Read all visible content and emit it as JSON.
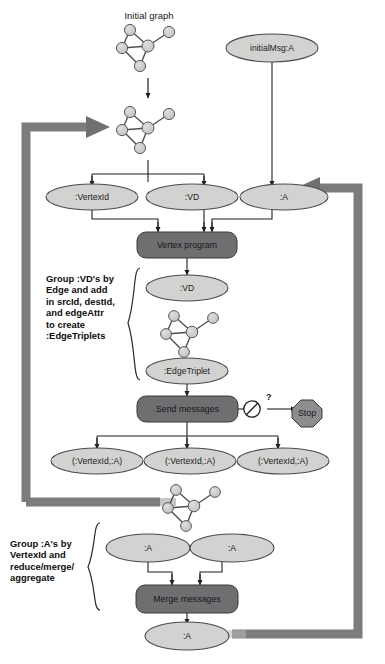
{
  "diagram": {
    "colors": {
      "ellipse_fill": "#d2d3d1",
      "ellipse_stroke": "#4a4a4a",
      "process_fill": "#6e6f70",
      "process_stroke": "#3a3a3a",
      "process_text": "#1a1a1a",
      "stop_fill": "#8c8d8e",
      "thick_arrow": "#7b7c7d",
      "thin_line": "#2b2b2b",
      "graph_node_fill": "#c9cac8",
      "graph_node_stroke": "#5a5a5a",
      "background": "#ffffff"
    },
    "labels": {
      "initial_graph": "Initial graph",
      "initial_msg": "initialMsg:A"
    },
    "nodes": {
      "vertex_id": ":VertexId",
      "vd": ":VD",
      "a": ":A",
      "vd_after": ":VD",
      "edge_triplet": ":EdgeTriplet",
      "vertexid_a_1": "(:VertexId,:A)",
      "vertexid_a_2": "(:VertexId,:A)",
      "vertexid_a_3": "(:VertexId,:A)",
      "a_left": ":A",
      "a_right": ":A",
      "a_final": ":A"
    },
    "processes": {
      "vertex_program": "Vertex program",
      "send_messages": "Send messages",
      "merge_messages": "Merge messages",
      "stop": "Stop"
    },
    "decision": {
      "question_mark": "?",
      "no_entry_symbol": "no-entry-icon"
    },
    "annotations": {
      "group_vd": "Group :VD's by\nEdge and add\nin srcId, destId,\nand edgeAttr\nto create\n:EdgeTriplets",
      "group_a": "Group :A's by\nVertexId and\nreduce/merge/\naggregate"
    },
    "graph_clusters": [
      {
        "name": "initial-graph-cluster",
        "nodes": [
          [
            26,
            8
          ],
          [
            65,
            10
          ],
          [
            44,
            24
          ],
          [
            18,
            26
          ],
          [
            36,
            44
          ]
        ],
        "edges": [
          [
            0,
            3
          ],
          [
            0,
            2
          ],
          [
            1,
            2
          ],
          [
            2,
            3
          ],
          [
            2,
            4
          ],
          [
            3,
            4
          ]
        ]
      },
      {
        "name": "iterated-graph-cluster",
        "nodes": [
          [
            26,
            8
          ],
          [
            65,
            10
          ],
          [
            44,
            24
          ],
          [
            18,
            26
          ],
          [
            36,
            44
          ]
        ],
        "edges": [
          [
            0,
            3
          ],
          [
            0,
            2
          ],
          [
            1,
            2
          ],
          [
            2,
            3
          ],
          [
            2,
            4
          ],
          [
            3,
            4
          ]
        ]
      },
      {
        "name": "triplet-graph-cluster",
        "nodes": [
          [
            26,
            8
          ],
          [
            65,
            10
          ],
          [
            44,
            24
          ],
          [
            18,
            26
          ],
          [
            36,
            44
          ]
        ],
        "edges": [
          [
            0,
            3
          ],
          [
            0,
            2
          ],
          [
            1,
            2
          ],
          [
            2,
            3
          ],
          [
            2,
            4
          ],
          [
            3,
            4
          ]
        ]
      },
      {
        "name": "message-graph-cluster",
        "nodes": [
          [
            26,
            8
          ],
          [
            65,
            10
          ],
          [
            44,
            24
          ],
          [
            18,
            26
          ],
          [
            36,
            44
          ]
        ],
        "edges": [
          [
            0,
            3
          ],
          [
            0,
            2
          ],
          [
            1,
            2
          ],
          [
            2,
            3
          ],
          [
            2,
            4
          ],
          [
            3,
            4
          ]
        ]
      }
    ]
  }
}
